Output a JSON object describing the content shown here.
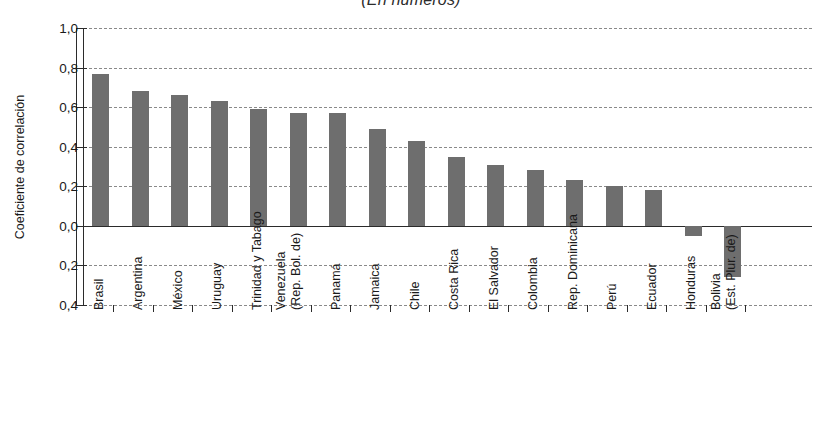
{
  "chart_data": {
    "type": "bar",
    "title": "(En números)",
    "xlabel": "",
    "ylabel": "Coeficiente de correlación",
    "ylim": [
      -0.4,
      1.0
    ],
    "ytick_labels": [
      "1,0",
      "0,8",
      "0,6",
      "0,4",
      "0,2",
      "0,0",
      "0,2",
      "0,4"
    ],
    "ytick_values": [
      1.0,
      0.8,
      0.6,
      0.4,
      0.2,
      0.0,
      -0.2,
      -0.4
    ],
    "grid": true,
    "legend": "none",
    "bar_color": "#6e6e6e",
    "categories": [
      "Brasil",
      "Argentina",
      "México",
      "Uruguay",
      "Trinidad y Tabago",
      "Venezuela (Rep. Bol. de)",
      "Panamá",
      "Jamaica",
      "Chile",
      "Costa Rica",
      "El Salvador",
      "Colombia",
      "Rep. Dominicana",
      "Perú",
      "Ecuador",
      "Honduras",
      "Bolivia (Est. Plur. de)"
    ],
    "category_lines": [
      [
        "Brasil",
        ""
      ],
      [
        "Argentina",
        ""
      ],
      [
        "México",
        ""
      ],
      [
        "Uruguay",
        ""
      ],
      [
        "Trinidad y Tabago",
        ""
      ],
      [
        "Venezuela",
        "(Rep. Bol. de)"
      ],
      [
        "Panamá",
        ""
      ],
      [
        "Jamaica",
        ""
      ],
      [
        "Chile",
        ""
      ],
      [
        "Costa Rica",
        ""
      ],
      [
        "El Salvador",
        ""
      ],
      [
        "Colombia",
        ""
      ],
      [
        "Rep. Dominicana",
        ""
      ],
      [
        "Perú",
        ""
      ],
      [
        "Ecuador",
        ""
      ],
      [
        "Honduras",
        ""
      ],
      [
        "Bolivia",
        "(Est. Plur. de)"
      ]
    ],
    "values": [
      0.77,
      0.68,
      0.66,
      0.63,
      0.59,
      0.57,
      0.57,
      0.49,
      0.43,
      0.35,
      0.31,
      0.28,
      0.23,
      0.2,
      0.18,
      -0.05,
      -0.26
    ]
  }
}
